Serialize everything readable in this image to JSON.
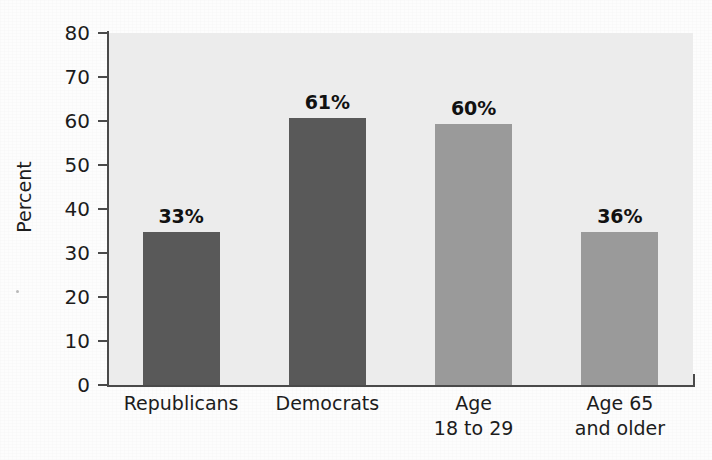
{
  "chart_data": {
    "type": "bar",
    "title": "",
    "subtitle": "",
    "xlabel": "",
    "ylabel": "Percent",
    "ylim": [
      0,
      80
    ],
    "yticks": [
      0,
      10,
      20,
      30,
      40,
      50,
      60,
      70,
      80
    ],
    "ytick_labels": [
      "0",
      "10",
      "20",
      "30",
      "40",
      "50",
      "60",
      "70",
      "80"
    ],
    "grid": false,
    "legend": null,
    "categories": [
      "Republicans",
      "Democrats",
      "Age 18 to 29",
      "Age 65 and older"
    ],
    "category_lines": [
      [
        "Republicans",
        ""
      ],
      [
        "Democrats",
        ""
      ],
      [
        "Age",
        "18 to 29"
      ],
      [
        "Age 65",
        "and older"
      ]
    ],
    "values": [
      33,
      61,
      60,
      36
    ],
    "plotted_values": [
      34.8,
      60.6,
      59.4,
      34.8
    ],
    "data_labels": [
      "33%",
      "61%",
      "60%",
      "36%"
    ],
    "bar_colors": [
      "#595959",
      "#595959",
      "#9a9a9a",
      "#9a9a9a"
    ],
    "bars": [
      {
        "category": "Republicans",
        "label_line1": "Republicans",
        "label_line2": "",
        "value": 33,
        "plotted_value": 34.8,
        "data_label": "33%",
        "color": "#595959",
        "group": "party"
      },
      {
        "category": "Democrats",
        "label_line1": "Democrats",
        "label_line2": "",
        "value": 61,
        "plotted_value": 60.6,
        "data_label": "61%",
        "color": "#595959",
        "group": "party"
      },
      {
        "category": "Age 18 to 29",
        "label_line1": "Age",
        "label_line2": "18 to 29",
        "value": 60,
        "plotted_value": 59.4,
        "data_label": "60%",
        "color": "#9a9a9a",
        "group": "age"
      },
      {
        "category": "Age 65 and older",
        "label_line1": "Age 65",
        "label_line2": "and older",
        "value": 36,
        "plotted_value": 34.8,
        "data_label": "36%",
        "color": "#9a9a9a",
        "group": "age"
      }
    ],
    "colors": {
      "plot_background": "#ececec",
      "page_background": "#fdfdfd",
      "axis": "#4a4a4a",
      "text": "#1c1c1c",
      "dark_bar": "#595959",
      "light_bar": "#9a9a9a"
    }
  }
}
